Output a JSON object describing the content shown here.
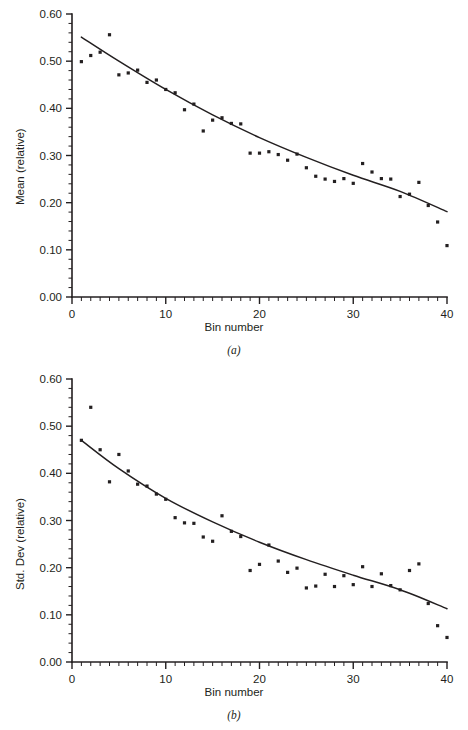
{
  "figure": {
    "panels": [
      "a",
      "b"
    ]
  },
  "panel_a": {
    "caption": "(a)",
    "xlabel": "Bin number",
    "ylabel": "Mean (relative)",
    "ytick_labels": [
      "0.00",
      "0.10",
      "0.20",
      "0.30",
      "0.40",
      "0.50",
      "0.60"
    ],
    "xtick_labels": [
      "0",
      "10",
      "20",
      "30",
      "40"
    ]
  },
  "panel_b": {
    "caption": "(b)",
    "xlabel": "Bin number",
    "ylabel": "Std. Dev (relative)",
    "ytick_labels": [
      "0.00",
      "0.10",
      "0.20",
      "0.30",
      "0.40",
      "0.50",
      "0.60"
    ],
    "xtick_labels": [
      "0",
      "10",
      "20",
      "30",
      "40"
    ]
  },
  "colors": {
    "ink": "#231f20",
    "background": "#ffffff"
  },
  "chart_data": [
    {
      "type": "scatter",
      "id": "panel-a",
      "title": "(a)",
      "xlabel": "Bin number",
      "ylabel": "Mean (relative)",
      "xlim": [
        0,
        40
      ],
      "ylim": [
        0.0,
        0.6
      ],
      "xticks": [
        0,
        10,
        20,
        30,
        40
      ],
      "yticks": [
        0.0,
        0.1,
        0.2,
        0.3,
        0.4,
        0.5,
        0.6
      ],
      "xtick_labels": [
        "0",
        "10",
        "20",
        "30",
        "40"
      ],
      "ytick_labels": [
        "0.00",
        "0.10",
        "0.20",
        "0.30",
        "0.40",
        "0.50",
        "0.60"
      ],
      "minor_tick_interval_x": 1,
      "minor_tick_interval_y": 0.02,
      "grid": false,
      "legend": null,
      "series": [
        {
          "name": "Mean (relative)",
          "marker": "square",
          "x": [
            1,
            2,
            3,
            4,
            5,
            6,
            7,
            8,
            9,
            10,
            11,
            12,
            13,
            14,
            15,
            16,
            17,
            18,
            19,
            20,
            21,
            22,
            23,
            24,
            25,
            26,
            27,
            28,
            29,
            30,
            31,
            32,
            33,
            34,
            35,
            36,
            37,
            38,
            39,
            40
          ],
          "y": [
            0.499,
            0.512,
            0.519,
            0.556,
            0.471,
            0.475,
            0.481,
            0.455,
            0.46,
            0.44,
            0.433,
            0.397,
            0.409,
            0.352,
            0.375,
            0.38,
            0.368,
            0.367,
            0.305,
            0.305,
            0.308,
            0.302,
            0.29,
            0.303,
            0.274,
            0.256,
            0.25,
            0.245,
            0.251,
            0.241,
            0.283,
            0.265,
            0.251,
            0.25,
            0.213,
            0.218,
            0.243,
            0.194,
            0.159,
            0.109
          ]
        }
      ],
      "fit_curve": {
        "name": "exponential fit",
        "description": "smooth monotonically decreasing fitted curve",
        "x": [
          1,
          5,
          10,
          15,
          20,
          25,
          30,
          35,
          40
        ],
        "y": [
          0.551,
          0.5,
          0.44,
          0.386,
          0.338,
          0.296,
          0.258,
          0.224,
          0.181
        ]
      }
    },
    {
      "type": "scatter",
      "id": "panel-b",
      "title": "(b)",
      "xlabel": "Bin number",
      "ylabel": "Std. Dev (relative)",
      "xlim": [
        0,
        40
      ],
      "ylim": [
        0.0,
        0.6
      ],
      "xticks": [
        0,
        10,
        20,
        30,
        40
      ],
      "yticks": [
        0.0,
        0.1,
        0.2,
        0.3,
        0.4,
        0.5,
        0.6
      ],
      "xtick_labels": [
        "0",
        "10",
        "20",
        "30",
        "40"
      ],
      "ytick_labels": [
        "0.00",
        "0.10",
        "0.20",
        "0.30",
        "0.40",
        "0.50",
        "0.60"
      ],
      "minor_tick_interval_x": 1,
      "minor_tick_interval_y": 0.02,
      "grid": false,
      "legend": null,
      "series": [
        {
          "name": "Std. Dev (relative)",
          "marker": "square",
          "x": [
            1,
            2,
            3,
            4,
            5,
            6,
            7,
            8,
            9,
            10,
            11,
            12,
            13,
            14,
            15,
            16,
            17,
            18,
            19,
            20,
            21,
            22,
            23,
            24,
            25,
            26,
            27,
            28,
            29,
            30,
            31,
            32,
            33,
            34,
            35,
            36,
            37,
            38,
            39,
            40
          ],
          "y": [
            0.47,
            0.54,
            0.45,
            0.382,
            0.44,
            0.405,
            0.377,
            0.373,
            0.356,
            0.345,
            0.306,
            0.295,
            0.294,
            0.265,
            0.256,
            0.31,
            0.277,
            0.266,
            0.194,
            0.207,
            0.248,
            0.214,
            0.19,
            0.199,
            0.157,
            0.161,
            0.186,
            0.16,
            0.183,
            0.164,
            0.202,
            0.16,
            0.187,
            0.162,
            0.153,
            0.194,
            0.208,
            0.124,
            0.077,
            0.052
          ]
        }
      ],
      "fit_curve": {
        "name": "exponential fit",
        "description": "smooth monotonically decreasing fitted curve",
        "x": [
          1,
          5,
          10,
          15,
          20,
          25,
          30,
          35,
          40
        ],
        "y": [
          0.47,
          0.41,
          0.347,
          0.297,
          0.254,
          0.217,
          0.184,
          0.153,
          0.113
        ]
      }
    }
  ]
}
